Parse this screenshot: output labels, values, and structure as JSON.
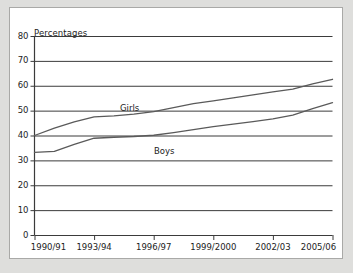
{
  "chart_data": {
    "type": "line",
    "title": "",
    "subtitle": "",
    "ylabel": "Percentages",
    "xlabel": "",
    "ylim": [
      0,
      80
    ],
    "yticks": [
      0,
      10,
      20,
      30,
      40,
      50,
      60,
      70,
      80
    ],
    "ytick_labels": [
      "0",
      "10",
      "20",
      "30",
      "40",
      "50",
      "60",
      "70",
      "80"
    ],
    "grid": true,
    "grid_axis": "y",
    "legend_position": "inline-annotations",
    "categories": [
      "1990/91",
      "1991/92",
      "1992/93",
      "1993/94",
      "1994/95",
      "1995/96",
      "1996/97",
      "1997/98",
      "1998/99",
      "1999/2000",
      "2000/01",
      "2001/02",
      "2002/03",
      "2003/04",
      "2004/05",
      "2005/06"
    ],
    "xtick_labels": [
      "1990/91",
      "1993/94",
      "1996/97",
      "1999/2000",
      "2002/03",
      "2005/06"
    ],
    "xtick_indices": [
      0,
      3,
      6,
      9,
      12,
      15
    ],
    "series": [
      {
        "name": "Girls",
        "color": "#5a5a5a",
        "values": [
          40.0,
          43.0,
          45.5,
          47.5,
          47.9,
          48.6,
          49.6,
          51.2,
          52.8,
          53.9,
          55.1,
          56.3,
          57.5,
          58.6,
          60.8,
          62.6
        ]
      },
      {
        "name": "Boys",
        "color": "#5a5a5a",
        "values": [
          33.2,
          33.6,
          36.4,
          38.9,
          39.3,
          39.6,
          40.1,
          41.2,
          42.4,
          43.6,
          44.6,
          45.6,
          46.7,
          48.2,
          50.8,
          53.2
        ]
      }
    ],
    "annotations": [
      {
        "text": "Girls",
        "x_px": 110,
        "y_px": 95
      },
      {
        "text": "Boys",
        "x_px": 144,
        "y_px": 138
      }
    ],
    "colors": {
      "line": "#5a5a5a",
      "grid": "#3b3b3b",
      "axis": "#3b3b3b",
      "text": "#1c1c1c",
      "page_background": "#dededc",
      "panel_background": "#ffffff",
      "panel_border": "#a9a9a7"
    }
  }
}
